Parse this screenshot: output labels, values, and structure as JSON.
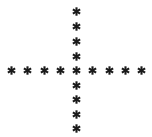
{
  "chart_data": {
    "type": "scatter",
    "title": "",
    "subtitle": "",
    "xlabel": "",
    "ylabel": "",
    "xlim": [
      0,
      152
    ],
    "ylim": [
      0,
      137
    ],
    "grid": false,
    "legend": null,
    "axes_visible": false,
    "background_color": "#ffffff",
    "marker_symbol": "asterisk",
    "marker_color": "#1a1a1a",
    "marker_size_px": 9,
    "series": [
      {
        "name": "horizontal-arm",
        "marker": "asterisk",
        "color": "#1a1a1a",
        "points": [
          {
            "x": 11,
            "y": 70
          },
          {
            "x": 27,
            "y": 70
          },
          {
            "x": 44,
            "y": 70
          },
          {
            "x": 60,
            "y": 70
          },
          {
            "x": 76,
            "y": 70
          },
          {
            "x": 92,
            "y": 70
          },
          {
            "x": 109,
            "y": 70
          },
          {
            "x": 125,
            "y": 70
          },
          {
            "x": 141,
            "y": 70
          }
        ]
      },
      {
        "name": "vertical-arm",
        "marker": "asterisk",
        "color": "#1a1a1a",
        "points": [
          {
            "x": 76,
            "y": 11
          },
          {
            "x": 76,
            "y": 26
          },
          {
            "x": 76,
            "y": 41
          },
          {
            "x": 76,
            "y": 56
          },
          {
            "x": 76,
            "y": 85
          },
          {
            "x": 76,
            "y": 99
          },
          {
            "x": 76,
            "y": 114
          },
          {
            "x": 76,
            "y": 128
          }
        ]
      }
    ],
    "point_count_total": 17,
    "center_point": {
      "x": 76,
      "y": 70
    }
  }
}
